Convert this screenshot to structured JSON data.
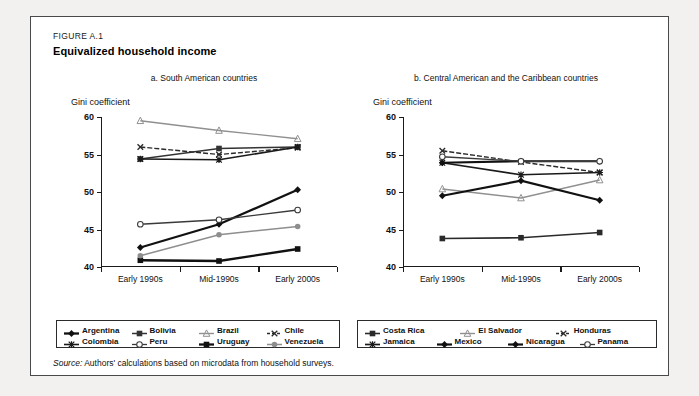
{
  "figure": {
    "label": "FIGURE A.1",
    "title": "Equivalized household income",
    "source_prefix": "Source:",
    "source_text": "Authors' calculations based on microdata from household surveys."
  },
  "colors": {
    "dark": "#1a1a1a",
    "grey": "#8c8c8c",
    "frame": "#4a4a4a",
    "page": "#f2f1ef",
    "card": "#ffffff"
  },
  "chart_data": [
    {
      "type": "line",
      "title": "a. South American countries",
      "ylabel": "Gini coefficient",
      "xlabel": "",
      "categories": [
        "Early 1990s",
        "Mid-1990s",
        "Early 2000s"
      ],
      "ylim": [
        40,
        60
      ],
      "yticks": [
        40,
        45,
        50,
        55,
        60
      ],
      "grid": false,
      "legend_position": "bottom",
      "series": [
        {
          "name": "Argentina",
          "values": [
            42.6,
            45.7,
            50.3
          ],
          "marker": "diamond",
          "color": "#111111",
          "width": 2.3,
          "dash": "none"
        },
        {
          "name": "Bolivia",
          "values": [
            54.4,
            55.8,
            56.0
          ],
          "marker": "square",
          "color": "#333333",
          "width": 1.5,
          "dash": "none"
        },
        {
          "name": "Brazil",
          "values": [
            59.5,
            58.2,
            57.1
          ],
          "marker": "triangle",
          "color": "#909090",
          "width": 1.4,
          "dash": "none"
        },
        {
          "name": "Chile",
          "values": [
            56.0,
            55.0,
            55.9
          ],
          "marker": "cross-x",
          "color": "#2a2a2a",
          "width": 1.4,
          "dash": "5,2"
        },
        {
          "name": "Colombia",
          "values": [
            54.4,
            54.3,
            56.0
          ],
          "marker": "plus",
          "color": "#1a1a1a",
          "width": 1.6,
          "dash": "none"
        },
        {
          "name": "Peru",
          "values": [
            45.7,
            46.3,
            47.6
          ],
          "marker": "circle-open",
          "color": "#3a3a3a",
          "width": 1.3,
          "dash": "none"
        },
        {
          "name": "Uruguay",
          "values": [
            40.9,
            40.8,
            42.4
          ],
          "marker": "square",
          "color": "#111111",
          "width": 2.3,
          "dash": "none"
        },
        {
          "name": "Venezuela",
          "values": [
            41.5,
            44.3,
            45.4
          ],
          "marker": "circle",
          "color": "#8e8e8e",
          "width": 1.5,
          "dash": "none"
        }
      ]
    },
    {
      "type": "line",
      "title": "b. Central American and the Caribbean countries",
      "ylabel": "Gini coefficient",
      "xlabel": "",
      "categories": [
        "Early 1990s",
        "Mid-1990s",
        "Early 2000s"
      ],
      "ylim": [
        40,
        60
      ],
      "yticks": [
        40,
        45,
        50,
        55,
        60
      ],
      "grid": false,
      "legend_position": "bottom",
      "series": [
        {
          "name": "Costa Rica",
          "values": [
            43.8,
            43.9,
            44.6
          ],
          "marker": "square",
          "color": "#2a2a2a",
          "width": 1.6,
          "dash": "none"
        },
        {
          "name": "El Salvador",
          "values": [
            50.4,
            49.2,
            51.6
          ],
          "marker": "triangle",
          "color": "#909090",
          "width": 1.4,
          "dash": "none"
        },
        {
          "name": "Honduras",
          "values": [
            55.5,
            54.0,
            52.6
          ],
          "marker": "cross-x",
          "color": "#2a2a2a",
          "width": 1.4,
          "dash": "5,2"
        },
        {
          "name": "Jamaica",
          "values": [
            53.9,
            52.3,
            52.6
          ],
          "marker": "plus",
          "color": "#1a1a1a",
          "width": 1.7,
          "dash": "none"
        },
        {
          "name": "Mexico",
          "values": [
            53.9,
            54.1,
            54.1
          ],
          "marker": "diamond",
          "color": "#111111",
          "width": 2.2,
          "dash": "none"
        },
        {
          "name": "Nicaragua",
          "values": [
            49.5,
            51.5,
            48.9
          ],
          "marker": "diamond",
          "color": "#111111",
          "width": 2.2,
          "dash": "none"
        },
        {
          "name": "Panama",
          "values": [
            54.7,
            54.1,
            54.1
          ],
          "marker": "circle-open",
          "color": "#3a3a3a",
          "width": 1.3,
          "dash": "none"
        }
      ]
    }
  ],
  "legends": {
    "left": {
      "rows": [
        [
          "Argentina",
          "Bolivia",
          "Brazil",
          "Chile"
        ],
        [
          "Colombia",
          "Peru",
          "Uruguay",
          "Venezuela"
        ]
      ]
    },
    "right": {
      "rows": [
        [
          "Costa Rica",
          "El Salvador",
          "Honduras"
        ],
        [
          "Jamaica",
          "Mexico",
          "Nicaragua",
          "Panama"
        ]
      ]
    }
  }
}
